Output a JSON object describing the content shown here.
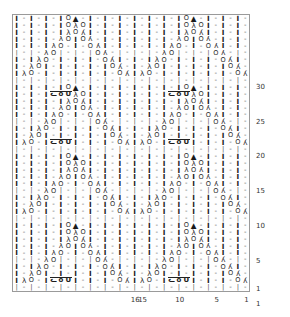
{
  "chart": {
    "type": "knitting-chart",
    "columns": 32,
    "rows": 40,
    "border_color": "#9a9a9a",
    "symbol_color": "#3a3a3a",
    "legend_glyphs": {
      "purl": "-",
      "knit": "|",
      "twisted-knit": "Ӏ",
      "ssk": "λ",
      "yarn-over": "O",
      "k2tog": "λ",
      "centered-double-decrease": "▲",
      "cable-left": "ᓚ",
      "cable-center": "o",
      "cable-right": "ᑌ"
    },
    "row_labels": [
      {
        "value": "30",
        "row_from_bottom": 30
      },
      {
        "value": "25",
        "row_from_bottom": 25
      },
      {
        "value": "20",
        "row_from_bottom": 20
      },
      {
        "value": "15",
        "row_from_bottom": 15
      },
      {
        "value": "10",
        "row_from_bottom": 10
      },
      {
        "value": "5",
        "row_from_bottom": 5
      },
      {
        "value": "1",
        "row_from_bottom": 1
      }
    ],
    "column_labels": [
      {
        "value": "16",
        "col_from_right": 16
      },
      {
        "value": "15",
        "col_from_right": 15
      },
      {
        "value": "10",
        "col_from_right": 10
      },
      {
        "value": "5",
        "col_from_right": 5
      },
      {
        "value": "1",
        "col_from_right": 1
      }
    ],
    "grid": [
      "t-l O|-t-t-t-tlO|-t-t-",
      "t-t-lO|-t-t-t-t-lO|-t-",
      "t-t-t-lO|-t-t-t-t-lO|-",
      "t-t-t-t-lO|-t-t-t-t-lO",
      "|-|-|-|-|-|-|-|-|-|-|-",
      "t-lO|-t-t-t-tlO|-t-t-t"
    ],
    "rows_data": [
      {
        "n": 40,
        "cells": "P|P|P|P|P|P|P|P|TPTP|P|P|P|P|P|P|TPTP|P|P|P|P|"
      },
      {
        "n": 1,
        "cells": "TPLOK|P|P|TPTPLOK|P|"
      }
    ]
  },
  "meta": {
    "bottom_axis_label": "1"
  }
}
